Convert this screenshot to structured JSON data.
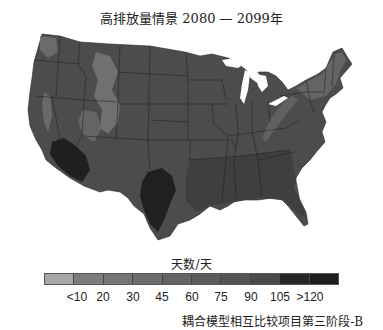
{
  "title": "高排放量情景 2080 — 2099年",
  "map": {
    "region": "contiguous-united-states",
    "states_outline_color": "#1a1a1a",
    "base_fill": "#4a4a4a",
    "highlands_fill": "#7a7a7a",
    "hot_fill": "#1a1a1a"
  },
  "legend": {
    "unit_label": "天数/天",
    "segments": [
      {
        "color": "#a6a6a6"
      },
      {
        "color": "#7c7c7c"
      },
      {
        "color": "#747474"
      },
      {
        "color": "#6c6c6c"
      },
      {
        "color": "#646464"
      },
      {
        "color": "#5c5c5c"
      },
      {
        "color": "#545454"
      },
      {
        "color": "#4a4a4a"
      },
      {
        "color": "#262626"
      },
      {
        "color": "#1e1e1e"
      }
    ],
    "ticks": [
      "<10",
      "20",
      "30",
      "45",
      "60",
      "75",
      "90",
      "105",
      ">120"
    ]
  },
  "source": "耦合模型相互比较项目第三阶段-B"
}
